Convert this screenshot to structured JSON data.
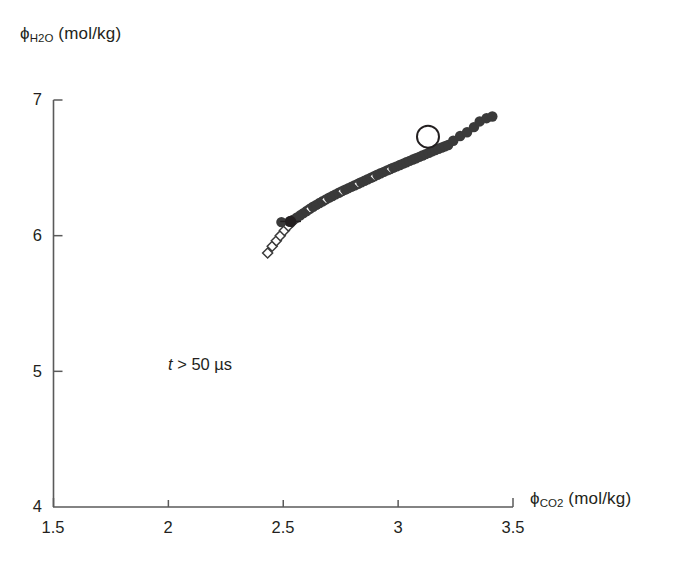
{
  "chart_data": {
    "type": "scatter",
    "title": "",
    "xlabel": "ϕ_CO2 (mol/kg)",
    "ylabel": "ϕ_H2O (mol/kg)",
    "xlabel_main": "ϕ",
    "xlabel_sub": "CO2",
    "xlabel_units": "(mol/kg)",
    "ylabel_main": "ϕ",
    "ylabel_sub": "H2O",
    "ylabel_units": "(mol/kg)",
    "xlim": [
      1.5,
      3.5
    ],
    "ylim": [
      4,
      7
    ],
    "xticks": [
      1.5,
      2,
      2.5,
      3,
      3.5
    ],
    "xtick_labels": [
      "1.5",
      "2",
      "2.5",
      "3",
      "3.5"
    ],
    "yticks": [
      4,
      5,
      6,
      7
    ],
    "ytick_labels": [
      "4",
      "5",
      "6",
      "7"
    ],
    "grid": false,
    "legend": null,
    "annotations": [
      {
        "text": "t > 50 µs",
        "italic_part": "t",
        "rest_part": "> 50 µs",
        "x": 2.0,
        "y": 5.07
      }
    ],
    "series": [
      {
        "name": "trajectory-open-tail",
        "marker": "open-diamond",
        "color": "#3a3a3a",
        "points": [
          [
            2.432,
            5.872
          ],
          [
            2.452,
            5.922
          ],
          [
            2.47,
            5.962
          ],
          [
            2.487,
            6.0
          ],
          [
            2.505,
            6.038
          ],
          [
            2.522,
            6.071
          ],
          [
            2.54,
            6.101
          ]
        ]
      },
      {
        "name": "trajectory-dense",
        "marker": "filled-circle",
        "color": "#3a3a3a",
        "points": [
          [
            2.492,
            6.1
          ],
          [
            2.527,
            6.104
          ],
          [
            2.545,
            6.118
          ],
          [
            2.56,
            6.134
          ],
          [
            2.574,
            6.15
          ],
          [
            2.588,
            6.166
          ],
          [
            2.602,
            6.182
          ],
          [
            2.616,
            6.198
          ],
          [
            2.63,
            6.213
          ],
          [
            2.644,
            6.227
          ],
          [
            2.658,
            6.241
          ],
          [
            2.672,
            6.254
          ],
          [
            2.686,
            6.267
          ],
          [
            2.7,
            6.28
          ],
          [
            2.714,
            6.292
          ],
          [
            2.728,
            6.304
          ],
          [
            2.742,
            6.316
          ],
          [
            2.756,
            6.328
          ],
          [
            2.77,
            6.339
          ],
          [
            2.784,
            6.35
          ],
          [
            2.798,
            6.361
          ],
          [
            2.812,
            6.372
          ],
          [
            2.826,
            6.383
          ],
          [
            2.84,
            6.394
          ],
          [
            2.854,
            6.405
          ],
          [
            2.868,
            6.416
          ],
          [
            2.882,
            6.427
          ],
          [
            2.896,
            6.438
          ],
          [
            2.91,
            6.449
          ],
          [
            2.924,
            6.46
          ],
          [
            2.938,
            6.47
          ],
          [
            2.952,
            6.481
          ],
          [
            2.966,
            6.491
          ],
          [
            2.98,
            6.501
          ],
          [
            2.994,
            6.511
          ],
          [
            3.008,
            6.521
          ],
          [
            3.022,
            6.531
          ],
          [
            3.036,
            6.541
          ],
          [
            3.05,
            6.551
          ],
          [
            3.064,
            6.561
          ],
          [
            3.078,
            6.571
          ],
          [
            3.092,
            6.581
          ],
          [
            3.106,
            6.591
          ],
          [
            3.12,
            6.601
          ],
          [
            3.134,
            6.611
          ],
          [
            3.148,
            6.621
          ],
          [
            3.162,
            6.631
          ],
          [
            3.176,
            6.641
          ],
          [
            3.19,
            6.65
          ],
          [
            3.204,
            6.659
          ],
          [
            3.218,
            6.668
          ],
          [
            3.24,
            6.7
          ],
          [
            3.27,
            6.735
          ],
          [
            3.3,
            6.762
          ],
          [
            3.33,
            6.8
          ],
          [
            3.355,
            6.842
          ],
          [
            3.385,
            6.866
          ],
          [
            3.41,
            6.878
          ]
        ]
      },
      {
        "name": "highlighted-point",
        "marker": "large-open-circle",
        "color": "#231f20",
        "points": [
          [
            3.13,
            6.73
          ]
        ]
      },
      {
        "name": "error-bar-point",
        "marker": "filled-circle-with-horizontal-bar",
        "color": "#231f20",
        "points": [
          [
            2.532,
            6.105
          ]
        ],
        "bar_half_width": 0.045
      }
    ]
  }
}
